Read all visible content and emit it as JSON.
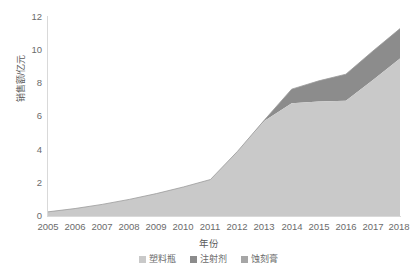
{
  "chart_data": {
    "type": "area",
    "stacked": true,
    "title": "",
    "xlabel": "年份",
    "ylabel": "销售额/亿元",
    "categories": [
      "2005",
      "2006",
      "2007",
      "2008",
      "2009",
      "2010",
      "2011",
      "2012",
      "2013",
      "2014",
      "2015",
      "2016",
      "2017",
      "2018"
    ],
    "x": [
      2005,
      2006,
      2007,
      2008,
      2009,
      2010,
      2011,
      2012,
      2013,
      2014,
      2015,
      2016,
      2017,
      2018
    ],
    "xlim": [
      2005,
      2018
    ],
    "ylim": [
      0,
      12
    ],
    "yticks": [
      0,
      2,
      4,
      6,
      8,
      10,
      12
    ],
    "xticks": [
      "2005",
      "2006",
      "2007",
      "2008",
      "2009",
      "2010",
      "2011",
      "2012",
      "2013",
      "2014",
      "2015",
      "2016",
      "2017",
      "2018"
    ],
    "grid": false,
    "legend_position": "bottom",
    "series": [
      {
        "name": "塑料瓶",
        "color": "#c9c9c9",
        "values": [
          0.25,
          0.45,
          0.7,
          1.0,
          1.35,
          1.75,
          2.2,
          3.9,
          5.75,
          6.8,
          6.9,
          6.95,
          8.2,
          9.5
        ]
      },
      {
        "name": "注射剂",
        "color": "#8c8c8c",
        "values": [
          0,
          0,
          0,
          0,
          0,
          0,
          0,
          0,
          0.05,
          0.85,
          1.25,
          1.6,
          1.75,
          1.8
        ]
      }
    ],
    "totals": [
      0.25,
      0.45,
      0.7,
      1.0,
      1.35,
      1.75,
      2.2,
      3.9,
      5.8,
      7.65,
      8.15,
      8.55,
      9.95,
      11.3
    ]
  },
  "axes": {
    "y_title": "销售额/亿元",
    "x_title": "年份",
    "y_tick_labels": [
      "12",
      "10",
      "8",
      "6",
      "4",
      "2",
      "0"
    ],
    "x_tick_labels": [
      "2005",
      "2006",
      "2007",
      "2008",
      "2009",
      "2010",
      "2011",
      "2012",
      "2013",
      "2014",
      "2015",
      "2016",
      "2017",
      "2018"
    ]
  },
  "legend": {
    "items": [
      {
        "label": "塑料瓶",
        "color": "#c9c9c9"
      },
      {
        "label": "注射剂",
        "color": "#8c8c8c"
      },
      {
        "label": "蚀刻膏",
        "color": "#a6a6a6"
      }
    ]
  },
  "colors": {
    "series1": "#c9c9c9",
    "series2": "#8c8c8c",
    "series3": "#a6a6a6",
    "axis": "#d9d9d9",
    "text": "#6b6b6b",
    "background": "#ffffff"
  }
}
